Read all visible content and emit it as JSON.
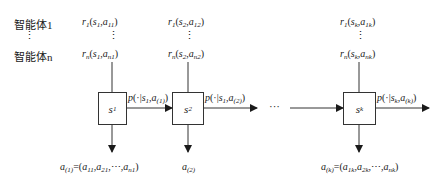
{
  "agents": {
    "first": "智能体1",
    "ellipsis": "⋮",
    "last": "智能体n"
  },
  "steps": [
    {
      "state": "s",
      "state_sub": "1",
      "reward_first": {
        "r": "r",
        "r_sub": "1",
        "args": "(s",
        "s_sub": "1",
        "mid": ",a",
        "a_sub": "11",
        "end": ")"
      },
      "reward_last": {
        "r": "r",
        "r_sub": "n",
        "args": "(s",
        "s_sub": "1",
        "mid": ",a",
        "a_sub": "n1",
        "end": ")"
      },
      "transition": {
        "p": "p(·|s",
        "s_sub": "1",
        "mid": ",a",
        "a_sub": "(1)",
        "end": ")"
      },
      "action": {
        "a": "a",
        "a_sub": "(1)",
        "eq": "=(a",
        "a1": "11",
        "c1": ",a",
        "a2": "21",
        "dots": ",⋯,a",
        "a3": "n1",
        "end": ")"
      }
    },
    {
      "state": "s",
      "state_sub": "2",
      "reward_first": {
        "r": "r",
        "r_sub": "1",
        "args": "(s",
        "s_sub": "2",
        "mid": ",a",
        "a_sub": "12",
        "end": ")"
      },
      "reward_last": {
        "r": "r",
        "r_sub": "n",
        "args": "(s",
        "s_sub": "2",
        "mid": ",a",
        "a_sub": "n2",
        "end": ")"
      },
      "transition": {
        "p": "p(·|s",
        "s_sub": "1",
        "mid": ",a",
        "a_sub": "(2)",
        "end": ")"
      },
      "action": {
        "a": "a",
        "a_sub": "(2)"
      }
    },
    {
      "state": "s",
      "state_sub": "k",
      "reward_first": {
        "r": "r",
        "r_sub": "1",
        "args": "(s",
        "s_sub": "k",
        "mid": ",a",
        "a_sub": "1k",
        "end": ")"
      },
      "reward_last": {
        "r": "r",
        "r_sub": "n",
        "args": "(s",
        "s_sub": "k",
        "mid": ",a",
        "a_sub": "nk",
        "end": ")"
      },
      "transition": {
        "p": "p(·|s",
        "s_sub": "k",
        "mid": ",a",
        "a_sub": "(k)",
        "end": ")"
      },
      "action": {
        "a": "a",
        "a_sub": "(k)",
        "eq": "=(a",
        "a1": "1k",
        "c1": ",a",
        "a2": "2k",
        "dots": ",⋯,a",
        "a3": "nk",
        "end": ")"
      }
    }
  ],
  "between_ellipsis": "···",
  "vdots": "⋮"
}
